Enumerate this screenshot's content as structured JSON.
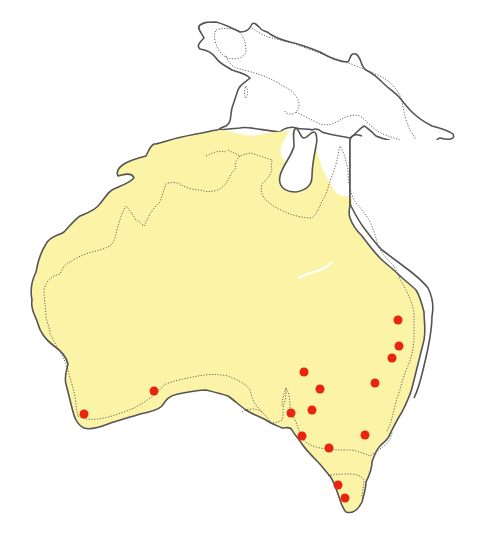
{
  "map": {
    "title": "",
    "regions": [
      {
        "name": "Australia",
        "shaded": true
      },
      {
        "name": "New Guinea",
        "shaded": false
      },
      {
        "name": "Tasmania",
        "shaded": true
      }
    ],
    "colors": {
      "range_fill": "#fbf3a6",
      "coastline": "#555555",
      "site_marker": "#e8260f",
      "background": "#ffffff"
    },
    "markers": [
      {
        "x": 398,
        "y": 320
      },
      {
        "x": 399,
        "y": 346
      },
      {
        "x": 392,
        "y": 358
      },
      {
        "x": 375,
        "y": 383
      },
      {
        "x": 304,
        "y": 372
      },
      {
        "x": 320,
        "y": 389
      },
      {
        "x": 312,
        "y": 410
      },
      {
        "x": 291,
        "y": 413
      },
      {
        "x": 302,
        "y": 436
      },
      {
        "x": 329,
        "y": 448
      },
      {
        "x": 365,
        "y": 435
      },
      {
        "x": 338,
        "y": 485
      },
      {
        "x": 345,
        "y": 498
      },
      {
        "x": 154,
        "y": 391
      },
      {
        "x": 84,
        "y": 414
      }
    ]
  }
}
